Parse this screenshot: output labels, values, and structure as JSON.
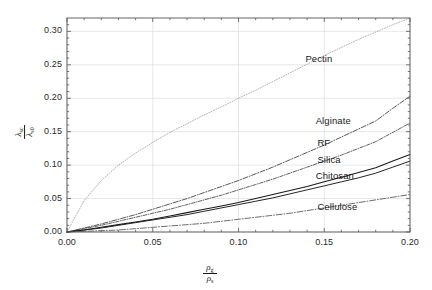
{
  "chart_data": {
    "type": "line",
    "title": "",
    "subtitle": "",
    "xlabel": "rho_g / rho_s",
    "ylabel": "lambda_sc / lambda_s0",
    "xlabel_numerator": "ρ",
    "xlabel_numerator_sub": "g",
    "xlabel_denominator": "ρ",
    "xlabel_denominator_sub": "s",
    "ylabel_numerator": "λ",
    "ylabel_numerator_sub": "sc",
    "ylabel_denominator": "λ",
    "ylabel_denominator_sub": "s0",
    "xlim": [
      0.0,
      0.2
    ],
    "ylim": [
      0.0,
      0.32
    ],
    "xticks": [
      0.0,
      0.05,
      0.1,
      0.15,
      0.2
    ],
    "xticklabels": [
      "0.00",
      "0.05",
      "0.10",
      "0.15",
      "0.20"
    ],
    "yticks": [
      0.0,
      0.05,
      0.1,
      0.15,
      0.2,
      0.25,
      0.3
    ],
    "yticklabels": [
      "0.00",
      "0.05",
      "0.10",
      "0.15",
      "0.20",
      "0.25",
      "0.30"
    ],
    "grid": true,
    "grid_color": "#d8d8d8",
    "frame_color": "#555555",
    "legend_position": "inline-annotations",
    "x": [
      0.0,
      0.01,
      0.02,
      0.03,
      0.04,
      0.05,
      0.06,
      0.07,
      0.08,
      0.09,
      0.1,
      0.11,
      0.12,
      0.13,
      0.14,
      0.15,
      0.16,
      0.17,
      0.18,
      0.19,
      0.2
    ],
    "series": [
      {
        "name": "Pectin",
        "color": "#8a8a8a",
        "linestyle": "dotted",
        "label_x": 0.139,
        "label_y": 0.258,
        "values": [
          0.0,
          0.047,
          0.077,
          0.1,
          0.118,
          0.134,
          0.149,
          0.162,
          0.175,
          0.187,
          0.2,
          0.212,
          0.225,
          0.238,
          0.251,
          0.264,
          0.276,
          0.288,
          0.299,
          0.31,
          0.32
        ]
      },
      {
        "name": "Alginate",
        "color": "#3a3a3a",
        "linestyle": "dashdot",
        "label_x": 0.145,
        "label_y": 0.166,
        "values": [
          0.0,
          0.006,
          0.012,
          0.019,
          0.026,
          0.034,
          0.042,
          0.05,
          0.059,
          0.068,
          0.077,
          0.087,
          0.097,
          0.108,
          0.119,
          0.13,
          0.142,
          0.154,
          0.166,
          0.185,
          0.203
        ]
      },
      {
        "name": "RF",
        "color": "#3a3a3a",
        "linestyle": "dashdot-fine",
        "label_x": 0.146,
        "label_y": 0.133,
        "values": [
          0.0,
          0.005,
          0.01,
          0.016,
          0.022,
          0.028,
          0.034,
          0.041,
          0.048,
          0.055,
          0.063,
          0.071,
          0.079,
          0.088,
          0.097,
          0.106,
          0.115,
          0.125,
          0.135,
          0.149,
          0.163
        ]
      },
      {
        "name": "Silica",
        "color": "#1a1a1a",
        "linestyle": "solid",
        "label_x": 0.146,
        "label_y": 0.108,
        "values": [
          0.0,
          0.003,
          0.007,
          0.011,
          0.015,
          0.019,
          0.024,
          0.029,
          0.034,
          0.039,
          0.044,
          0.05,
          0.056,
          0.062,
          0.068,
          0.075,
          0.082,
          0.089,
          0.096,
          0.106,
          0.116
        ]
      },
      {
        "name": "Chitosan",
        "color": "#1a1a1a",
        "linestyle": "solid-thin",
        "label_x": 0.145,
        "label_y": 0.083,
        "values": [
          0.0,
          0.003,
          0.006,
          0.01,
          0.014,
          0.018,
          0.022,
          0.026,
          0.031,
          0.036,
          0.041,
          0.046,
          0.051,
          0.057,
          0.063,
          0.069,
          0.075,
          0.081,
          0.088,
          0.097,
          0.106
        ]
      },
      {
        "name": "Cellulose",
        "color": "#4a4a4a",
        "linestyle": "dashdot-long",
        "label_x": 0.146,
        "label_y": 0.038,
        "values": [
          0.0,
          0.001,
          0.002,
          0.003,
          0.005,
          0.007,
          0.009,
          0.011,
          0.013,
          0.016,
          0.019,
          0.022,
          0.025,
          0.028,
          0.032,
          0.036,
          0.04,
          0.044,
          0.048,
          0.052,
          0.056
        ]
      }
    ]
  }
}
